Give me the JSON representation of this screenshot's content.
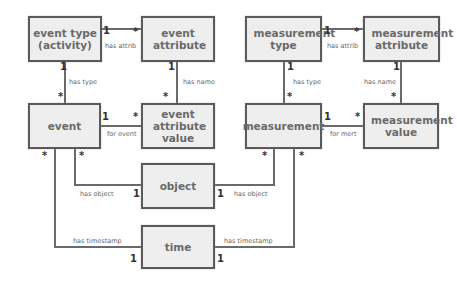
{
  "entities": {
    "event_type": "event type (activity)",
    "event_attribute": "event attribute",
    "event": "event",
    "event_attribute_value": "event attribute value",
    "measurement_type": "measurement type",
    "measurement_attribute": "measurement attribute",
    "measurement": "measurement",
    "measurement_value": "measurement value",
    "object": "object",
    "time": "time"
  },
  "relations": {
    "ev_has_attrib": "has attrib",
    "ev_has_type": "has type",
    "ev_has_name": "has name",
    "ev_for_event": "for event",
    "ev_has_object": "has object",
    "ev_has_timestamp": "has timestamp",
    "m_has_attrib": "has attrib",
    "m_has_type": "has type",
    "m_has_name": "has name",
    "m_for_mert": "for mert",
    "m_has_object": "has object",
    "m_has_timestamp": "has timestamp"
  },
  "cardinality": {
    "one": "1",
    "many": "*"
  }
}
